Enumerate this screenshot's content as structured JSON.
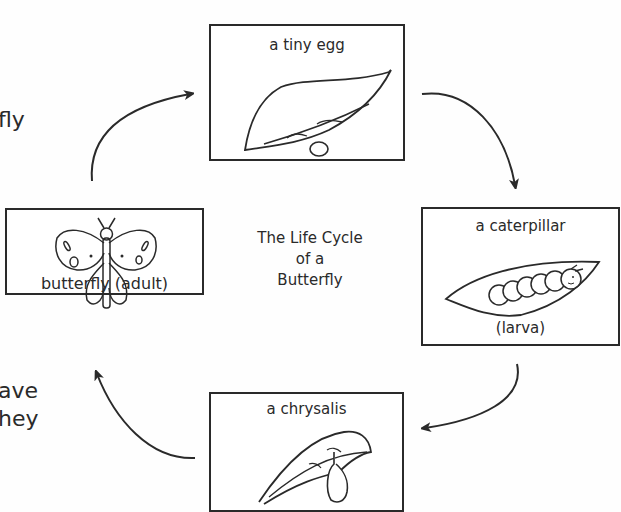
{
  "diagram": {
    "title_lines": [
      "The Life Cycle",
      "of a",
      "Butterfly"
    ],
    "stages": [
      {
        "id": "egg",
        "label": "a tiny egg"
      },
      {
        "id": "caterpillar",
        "label": "a caterpillar",
        "sublabel": "(larva)"
      },
      {
        "id": "chrysalis",
        "label": "a chrysalis"
      },
      {
        "id": "butterfly",
        "label": "butterfly (adult)"
      }
    ],
    "arrows": [
      "butterfly-to-egg",
      "egg-to-caterpillar",
      "caterpillar-to-chrysalis",
      "chrysalis-to-butterfly"
    ]
  },
  "cropped_text": [
    "fly",
    "ave",
    "hey"
  ],
  "colors": {
    "ink": "#2a2a2a",
    "background": "#fefefe"
  }
}
